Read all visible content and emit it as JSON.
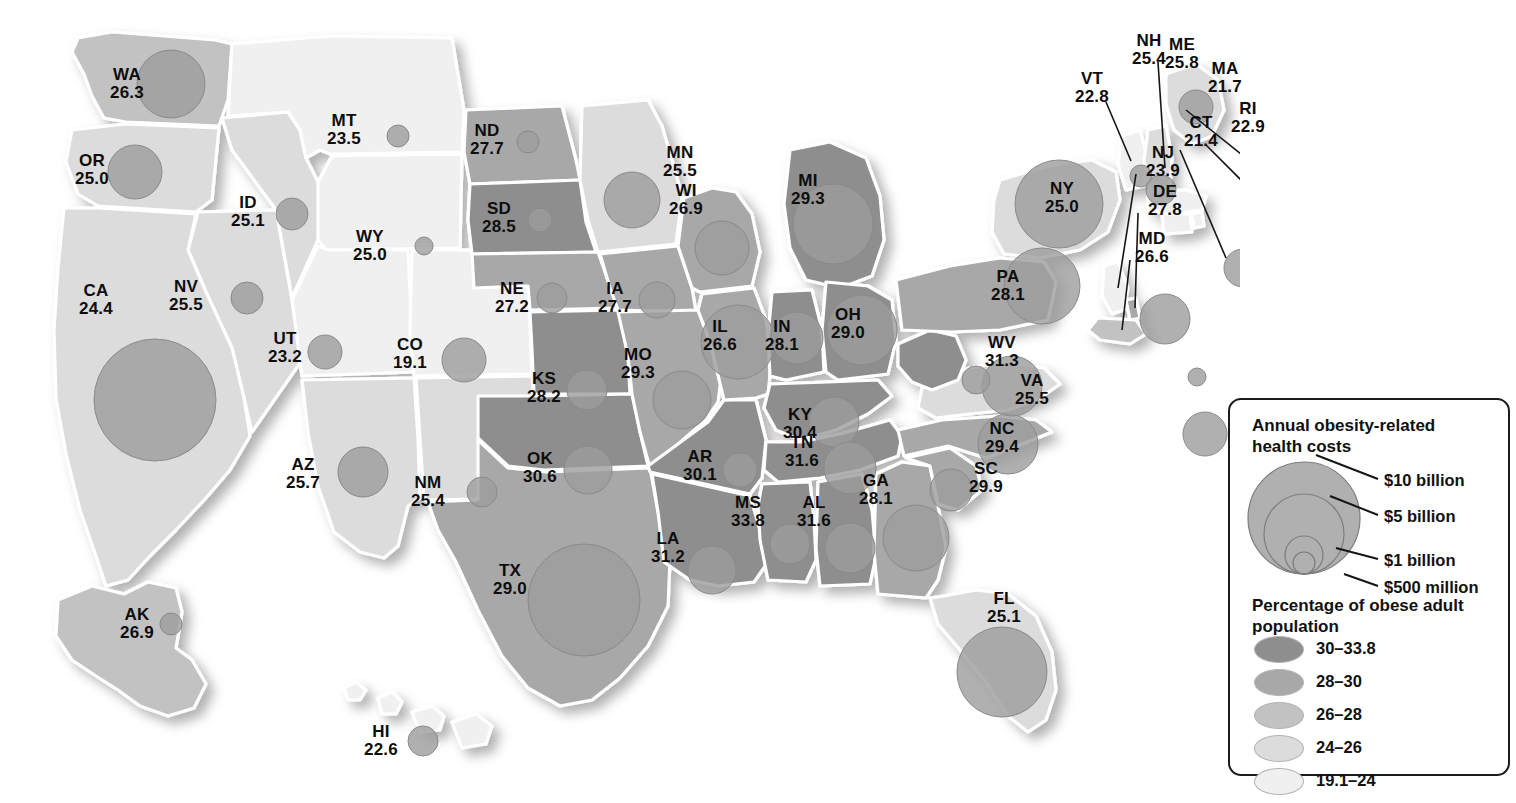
{
  "chart_data": {
    "type": "map",
    "value_label": "Percentage of obese adult population",
    "size_label": "Annual obesity-related health costs",
    "states": [
      {
        "abbr": "WA",
        "value": "26.3",
        "num": 26.3,
        "cost_r": 34,
        "band": 2
      },
      {
        "abbr": "OR",
        "value": "25.0",
        "num": 25.0,
        "cost_r": 27,
        "band": 3
      },
      {
        "abbr": "ID",
        "value": "25.1",
        "num": 25.1,
        "cost_r": 16,
        "band": 3
      },
      {
        "abbr": "MT",
        "value": "23.5",
        "num": 23.5,
        "cost_r": 11,
        "band": 4
      },
      {
        "abbr": "WY",
        "value": "25.0",
        "num": 25.0,
        "cost_r": 9,
        "band": 4
      },
      {
        "abbr": "NV",
        "value": "25.5",
        "num": 25.5,
        "cost_r": 16,
        "band": 3
      },
      {
        "abbr": "UT",
        "value": "23.2",
        "num": 23.2,
        "cost_r": 17,
        "band": 4
      },
      {
        "abbr": "CA",
        "value": "24.4",
        "num": 24.4,
        "cost_r": 61,
        "band": 3
      },
      {
        "abbr": "AZ",
        "value": "25.7",
        "num": 25.7,
        "cost_r": 25,
        "band": 3
      },
      {
        "abbr": "NM",
        "value": "25.4",
        "num": 25.4,
        "cost_r": 15,
        "band": 3
      },
      {
        "abbr": "CO",
        "value": "19.1",
        "num": 19.1,
        "cost_r": 22,
        "band": 4
      },
      {
        "abbr": "ND",
        "value": "27.7",
        "num": 27.7,
        "cost_r": 11,
        "band": 1
      },
      {
        "abbr": "SD",
        "value": "28.5",
        "num": 28.5,
        "cost_r": 12,
        "band": 0
      },
      {
        "abbr": "NE",
        "value": "27.2",
        "num": 27.2,
        "cost_r": 15,
        "band": 1
      },
      {
        "abbr": "KS",
        "value": "28.2",
        "num": 28.2,
        "cost_r": 20,
        "band": 0
      },
      {
        "abbr": "OK",
        "value": "30.6",
        "num": 30.6,
        "cost_r": 24,
        "band": 0
      },
      {
        "abbr": "TX",
        "value": "29.0",
        "num": 29.0,
        "cost_r": 56,
        "band": 1
      },
      {
        "abbr": "MN",
        "value": "25.5",
        "num": 25.5,
        "cost_r": 28,
        "band": 3
      },
      {
        "abbr": "IA",
        "value": "27.7",
        "num": 27.7,
        "cost_r": 18,
        "band": 1
      },
      {
        "abbr": "MO",
        "value": "29.3",
        "num": 29.3,
        "cost_r": 29,
        "band": 1
      },
      {
        "abbr": "AR",
        "value": "30.1",
        "num": 30.1,
        "cost_r": 17,
        "band": 0
      },
      {
        "abbr": "LA",
        "value": "31.2",
        "num": 31.2,
        "cost_r": 24,
        "band": 0
      },
      {
        "abbr": "WI",
        "value": "26.9",
        "num": 26.9,
        "cost_r": 27,
        "band": 1
      },
      {
        "abbr": "IL",
        "value": "26.6",
        "num": 26.6,
        "cost_r": 37,
        "band": 1
      },
      {
        "abbr": "MI",
        "value": "29.3",
        "num": 29.3,
        "cost_r": 40,
        "band": 0
      },
      {
        "abbr": "IN",
        "value": "28.1",
        "num": 28.1,
        "cost_r": 26,
        "band": 0
      },
      {
        "abbr": "OH",
        "value": "29.0",
        "num": 29.0,
        "cost_r": 35,
        "band": 0
      },
      {
        "abbr": "KY",
        "value": "30.4",
        "num": 30.4,
        "cost_r": 25,
        "band": 0
      },
      {
        "abbr": "TN",
        "value": "31.6",
        "num": 31.6,
        "cost_r": 26,
        "band": 0
      },
      {
        "abbr": "MS",
        "value": "33.8",
        "num": 33.8,
        "cost_r": 20,
        "band": 0
      },
      {
        "abbr": "AL",
        "value": "31.6",
        "num": 31.6,
        "cost_r": 25,
        "band": 0
      },
      {
        "abbr": "GA",
        "value": "28.1",
        "num": 28.1,
        "cost_r": 33,
        "band": 1
      },
      {
        "abbr": "FL",
        "value": "25.1",
        "num": 25.1,
        "cost_r": 45,
        "band": 3
      },
      {
        "abbr": "SC",
        "value": "29.9",
        "num": 29.9,
        "cost_r": 21,
        "band": 1
      },
      {
        "abbr": "NC",
        "value": "29.4",
        "num": 29.4,
        "cost_r": 30,
        "band": 1
      },
      {
        "abbr": "VA",
        "value": "25.5",
        "num": 25.5,
        "cost_r": 30,
        "band": 3
      },
      {
        "abbr": "WV",
        "value": "31.3",
        "num": 31.3,
        "cost_r": 14,
        "band": 0
      },
      {
        "abbr": "PA",
        "value": "28.1",
        "num": 28.1,
        "cost_r": 38,
        "band": 1
      },
      {
        "abbr": "NY",
        "value": "25.0",
        "num": 25.0,
        "cost_r": 44,
        "band": 3
      },
      {
        "abbr": "VT",
        "value": "22.8",
        "num": 22.8,
        "cost_r": 11,
        "band": 4
      },
      {
        "abbr": "NH",
        "value": "25.4",
        "num": 25.4,
        "cost_r": 15,
        "band": 3
      },
      {
        "abbr": "ME",
        "value": "25.8",
        "num": 25.8,
        "cost_r": 17,
        "band": 3
      },
      {
        "abbr": "MA",
        "value": "21.7",
        "num": 21.7,
        "cost_r": 28,
        "band": 4
      },
      {
        "abbr": "RI",
        "value": "22.9",
        "num": 22.9,
        "cost_r": 12,
        "band": 4
      },
      {
        "abbr": "CT",
        "value": "21.4",
        "num": 21.4,
        "cost_r": 19,
        "band": 4
      },
      {
        "abbr": "NJ",
        "value": "23.9",
        "num": 23.9,
        "cost_r": 25,
        "band": 4
      },
      {
        "abbr": "DE",
        "value": "27.8",
        "num": 27.8,
        "cost_r": 9,
        "band": 1
      },
      {
        "abbr": "MD",
        "value": "26.6",
        "num": 26.6,
        "cost_r": 22,
        "band": 2
      },
      {
        "abbr": "AK",
        "value": "26.9",
        "num": 26.9,
        "cost_r": 11,
        "band": 2
      },
      {
        "abbr": "HI",
        "value": "22.6",
        "num": 22.6,
        "cost_r": 15,
        "band": 4
      }
    ]
  },
  "legend": {
    "cost_title": "Annual obesity-related health costs",
    "cost_items": [
      {
        "label": "$10 billion"
      },
      {
        "label": "$5 billion"
      },
      {
        "label": "$1 billion"
      },
      {
        "label": "$500 million"
      }
    ],
    "pct_title": "Percentage of obese adult population",
    "pct_items": [
      {
        "label": "30–33.8",
        "color": "#8e8e8e"
      },
      {
        "label": "28–30",
        "color": "#a8a8a8"
      },
      {
        "label": "26–28",
        "color": "#c2c2c2"
      },
      {
        "label": "24–26",
        "color": "#dcdcdc"
      },
      {
        "label": "19.1–24",
        "color": "#f0f0f0"
      }
    ]
  },
  "colors": {
    "band0": "#8e8e8e",
    "band1": "#a8a8a8",
    "band2": "#c2c2c2",
    "band3": "#dcdcdc",
    "band4": "#f0f0f0",
    "bubble": "#9c9c9c",
    "border": "#ffffff",
    "text": "#0d0d0d"
  }
}
